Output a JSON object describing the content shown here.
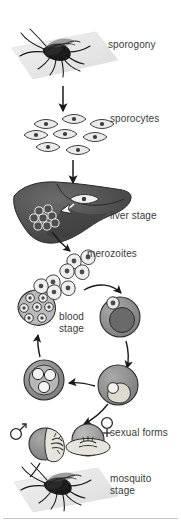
{
  "diagram": {
    "labels": {
      "sporogony": "sporogony",
      "sporocytes": "sporocytes",
      "liver_stage": "liver stage",
      "merozoites": "merozoites",
      "blood_stage": "blood\nstage",
      "sexual_forms": "sexual forms",
      "mosquito_stage": "mosquito\nstage"
    },
    "symbols": {
      "male": "♂",
      "female": "♀"
    },
    "colors": {
      "background": "#ffffff",
      "text": "#3a3a3a",
      "ink": "#1a1a1a",
      "ground_plane": "#e8e8e8",
      "liver_dark": "#4a4a4a",
      "liver_mid": "#5e5e5e",
      "cell_gray": "#8d8d8d",
      "cell_light": "#c8c8c8",
      "cell_outline": "#2b2b2b",
      "rule": "#c9c9c9"
    },
    "stages": [
      {
        "id": "sporogony",
        "label": "sporogony",
        "icon": "mosquito-on-plane-icon"
      },
      {
        "id": "sporocytes",
        "label": "sporocytes",
        "icon": "sporozoite-cluster-icon",
        "count": 8
      },
      {
        "id": "liver-stage",
        "label": "liver stage",
        "icon": "liver-icon"
      },
      {
        "id": "merozoites",
        "label": "merozoites",
        "icon": "merozoite-cluster-icon",
        "count": 6
      },
      {
        "id": "blood-stage",
        "label": "blood\nstage",
        "icon": "erythrocyte-cycle-icon",
        "cells": [
          "ring-stage",
          "trophozoite",
          "schizont",
          "rupturing-schizont"
        ]
      },
      {
        "id": "sexual-forms",
        "label": "sexual forms",
        "icon": "gametocyte-pair-icon"
      },
      {
        "id": "mosquito-stage",
        "label": "mosquito\nstage",
        "icon": "mosquito-on-plane-icon"
      }
    ]
  }
}
